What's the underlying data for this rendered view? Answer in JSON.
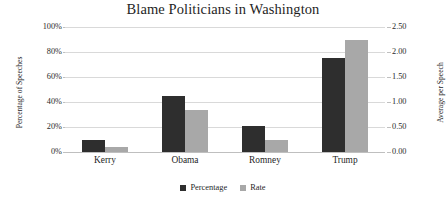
{
  "chart_data": {
    "type": "bar",
    "title": "Blame Politicians in Washington",
    "xlabel": "",
    "categories": [
      "Kerry",
      "Obama",
      "Romney",
      "Trump"
    ],
    "series": [
      {
        "name": "Percentage",
        "axis": "left",
        "color": "#2e2e2e",
        "values": [
          10,
          45,
          21,
          75
        ],
        "value_labels": [
          "10%",
          "45%",
          "21%",
          "75%"
        ]
      },
      {
        "name": "Rate",
        "axis": "right",
        "color": "#a8a8a8",
        "values": [
          0.1,
          0.85,
          0.25,
          2.25
        ],
        "value_labels": [
          "0.10",
          "0.85",
          "0.25",
          "2.25"
        ]
      }
    ],
    "axes": {
      "left": {
        "label": "Percentage of Speeches",
        "min": 0,
        "max": 100,
        "step": 20,
        "ticks": [
          "0%",
          "20%",
          "40%",
          "60%",
          "80%",
          "100%"
        ]
      },
      "right": {
        "label": "Average per Speech",
        "min": 0,
        "max": 2.5,
        "step": 0.5,
        "ticks": [
          "0.00",
          "0.50",
          "1.00",
          "1.50",
          "2.00",
          "2.50"
        ]
      }
    },
    "grid": true,
    "legend": {
      "position": "bottom",
      "entries": [
        "Percentage",
        "Rate"
      ]
    }
  }
}
